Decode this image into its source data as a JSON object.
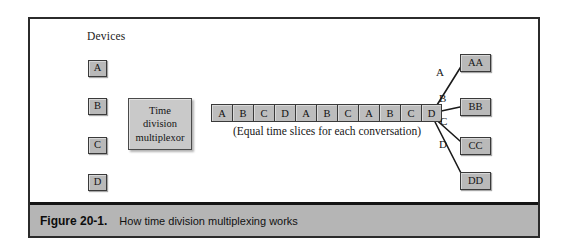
{
  "figure": {
    "caption_number": "Figure 20-1.",
    "caption_text": "How time division multiplexing works",
    "devices_label": "Devices",
    "multiplexor_line1": "Time",
    "multiplexor_line2": "division",
    "multiplexor_line3": "multiplexor",
    "timeslice_caption": "(Equal time slices for each conversation)"
  },
  "devices": [
    {
      "label": "A"
    },
    {
      "label": "B"
    },
    {
      "label": "C"
    },
    {
      "label": "D"
    }
  ],
  "time_slices": [
    {
      "label": "A"
    },
    {
      "label": "B"
    },
    {
      "label": "C"
    },
    {
      "label": "D"
    },
    {
      "label": "A"
    },
    {
      "label": "B"
    },
    {
      "label": "C"
    },
    {
      "label": "A"
    },
    {
      "label": "B"
    },
    {
      "label": "C"
    },
    {
      "label": "D"
    }
  ],
  "branches": [
    {
      "label": "A"
    },
    {
      "label": "B"
    },
    {
      "label": "C"
    },
    {
      "label": "D"
    }
  ],
  "endpoints": [
    {
      "label": "AA"
    },
    {
      "label": "BB"
    },
    {
      "label": "CC"
    },
    {
      "label": "DD"
    }
  ],
  "colors": {
    "page_background": "#ffffff",
    "frame_border": "#2b2b2b",
    "box_fill": "#b9b9b9",
    "multiplexor_fill": "#c9c9c9",
    "slice_fill": "#bdbdbd",
    "caption_bar": "#b5b5b5",
    "line_stroke": "#1a1a1a"
  }
}
